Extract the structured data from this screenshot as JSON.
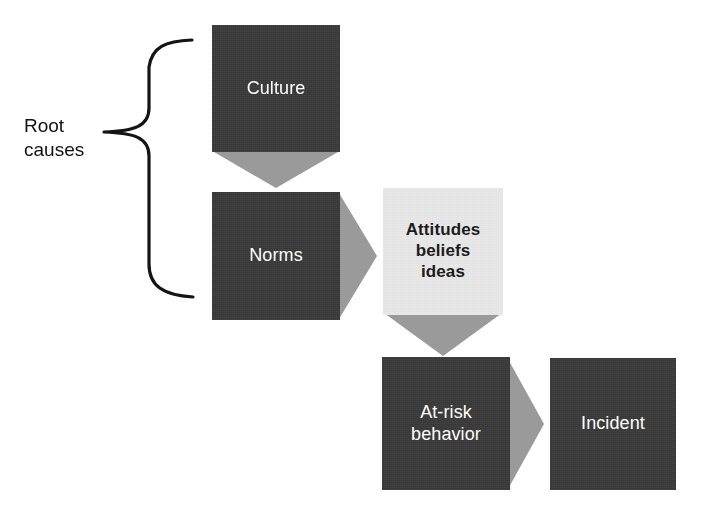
{
  "diagram": {
    "background_color": "#ffffff",
    "colors": {
      "node_dark": "#3c3c3c",
      "node_dark_text": "#ffffff",
      "node_light": "#e6e6e6",
      "node_light_text": "#1c1c1c",
      "arrow_gray": "#9a9a9a",
      "brace_stroke": "#141414",
      "label_text": "#111111"
    },
    "bracket_label": "Root\ncauses",
    "nodes": [
      {
        "id": "culture",
        "label": "Culture",
        "style": "dark",
        "x": 212,
        "y": 25,
        "w": 128,
        "h": 127
      },
      {
        "id": "norms",
        "label": "Norms",
        "style": "dark",
        "x": 212,
        "y": 192,
        "w": 128,
        "h": 128
      },
      {
        "id": "attitudes",
        "label": "Attitudes\nbeliefs\nideas",
        "style": "light",
        "x": 383,
        "y": 188,
        "w": 120,
        "h": 127
      },
      {
        "id": "at-risk-behavior",
        "label": "At-risk\nbehavior",
        "style": "dark",
        "x": 382,
        "y": 357,
        "w": 128,
        "h": 133
      },
      {
        "id": "incident",
        "label": "Incident",
        "style": "dark",
        "x": 550,
        "y": 358,
        "w": 126,
        "h": 132
      }
    ],
    "arrows": [
      {
        "id": "culture-to-norms",
        "from": "culture",
        "to": "norms",
        "direction": "down"
      },
      {
        "id": "norms-to-attitudes",
        "from": "norms",
        "to": "attitudes",
        "direction": "right"
      },
      {
        "id": "attitudes-to-at-risk-behavior",
        "from": "attitudes",
        "to": "at-risk-behavior",
        "direction": "down"
      },
      {
        "id": "at-risk-behavior-to-incident",
        "from": "at-risk-behavior",
        "to": "incident",
        "direction": "right"
      }
    ],
    "bracket": {
      "groups": [
        "culture",
        "norms"
      ],
      "orientation": "right-facing-curly-brace",
      "top": 48,
      "bottom": 300,
      "tip_y": 132
    }
  }
}
